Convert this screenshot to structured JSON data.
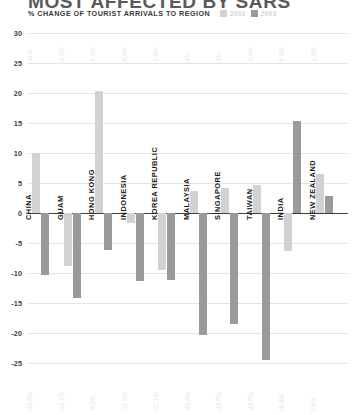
{
  "header": {
    "title": "MOST AFFECTED BY SARS",
    "subtitle": "% CHANGE OF TOURIST ARRIVALS TO REGION"
  },
  "legend": {
    "items": [
      {
        "label": "2002",
        "color": "#d2d2d2"
      },
      {
        "label": "2003",
        "color": "#9a9a9a"
      }
    ]
  },
  "chart_data": {
    "type": "bar",
    "title": "MOST AFFECTED BY SARS",
    "subtitle": "% CHANGE OF TOURIST ARRIVALS TO REGION",
    "xlabel": "",
    "ylabel": "% change of tourist arrivals to region",
    "ylim": [
      -25,
      30
    ],
    "ytick_values": [
      30,
      25,
      20,
      15,
      10,
      5,
      0,
      -5,
      -10,
      -15,
      -20,
      -25
    ],
    "ytick_labels": [
      "30",
      "25",
      "20",
      "15",
      "10",
      "5",
      "0",
      "-5",
      "-10",
      "-15",
      "-20",
      "-25"
    ],
    "grid": true,
    "legend_position": "top",
    "categories": [
      "CHINA",
      "GUAM",
      "HONG KONG",
      "INDONESIA",
      "KOREA REPUBLIC",
      "MALAYSIA",
      "SINGAPORE",
      "TAIWAN",
      "INDIA",
      "NEW ZEALAND"
    ],
    "series": [
      {
        "name": "2002",
        "color": "#d2d2d2",
        "values": [
          10.0,
          -8.8,
          20.3,
          -1.7,
          -9.5,
          3.6,
          4.2,
          4.6,
          -6.4,
          6.5
        ],
        "labels": [
          "-11%",
          "-4.1%",
          "-2.1%",
          "-0.4%",
          "-2.8%",
          "-4%",
          "-4%",
          "-0.4%",
          "-6.9%",
          "-1.5%"
        ]
      },
      {
        "name": "2003",
        "color": "#9a9a9a",
        "values": [
          -10.4,
          -14.1,
          -6.2,
          -11.3,
          -11.1,
          -20.4,
          -18.5,
          -24.5,
          15.4,
          2.8
        ],
        "labels": [
          "-10.4%",
          "-14.1%",
          "-6.2%",
          "-11.3%",
          "-11.1%",
          "-20.4%",
          "-18.5%",
          "-24.5%",
          "15.4%",
          "2.8%"
        ]
      }
    ]
  }
}
